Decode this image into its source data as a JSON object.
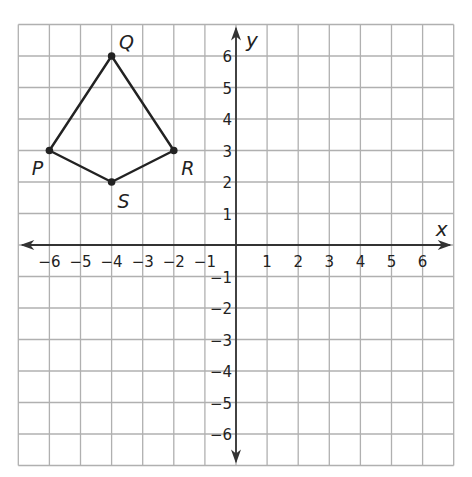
{
  "diagram": {
    "type": "coordinate-plane",
    "x_axis_label": "x",
    "y_axis_label": "y",
    "x_range": [
      -7,
      7
    ],
    "y_range": [
      -7,
      7
    ],
    "x_ticks": [
      "-6",
      "-5",
      "-4",
      "-3",
      "-2",
      "-1",
      "1",
      "2",
      "3",
      "4",
      "5",
      "6"
    ],
    "y_ticks": [
      "6",
      "5",
      "4",
      "3",
      "2",
      "1",
      "-1",
      "-2",
      "-3",
      "-4",
      "-5",
      "-6"
    ],
    "polygon": {
      "name": "PQRS",
      "vertices": [
        {
          "label": "P",
          "x": -6,
          "y": 3
        },
        {
          "label": "Q",
          "x": -4,
          "y": 6
        },
        {
          "label": "R",
          "x": -2,
          "y": 3
        },
        {
          "label": "S",
          "x": -4,
          "y": 2
        }
      ],
      "order": [
        "P",
        "Q",
        "R",
        "S"
      ]
    },
    "colors": {
      "grid": "#b0b0b0",
      "axis": "#333333",
      "polygon": "#222222"
    }
  }
}
